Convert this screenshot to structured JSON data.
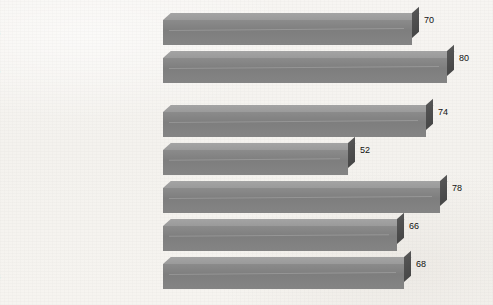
{
  "chart_data": {
    "type": "bar",
    "orientation": "horizontal",
    "title": "",
    "subtitle": "",
    "xlabel": "",
    "ylabel": "",
    "categories": [
      "Hispanic",
      "Not Hispanic",
      "Mexican",
      "Puerto Rican",
      "Cuban",
      "Central and South American",
      "Other Hispanic"
    ],
    "values": [
      70,
      80,
      74,
      52,
      78,
      66,
      68
    ],
    "value_labels": [
      "70",
      "80",
      "74",
      "52",
      "78",
      "66",
      "68"
    ],
    "xlim": [
      0,
      80
    ],
    "grid": false,
    "legend": null,
    "axis_ticks_visible": false,
    "style": "3d-bars",
    "group_break_after_index": 1,
    "colors": {
      "bar_top": "#9a9a9a",
      "bar_front": "#7e7e7e",
      "bar_cap": "#474747",
      "background": "#f6f4f1",
      "text": "#1c1c1c"
    }
  }
}
